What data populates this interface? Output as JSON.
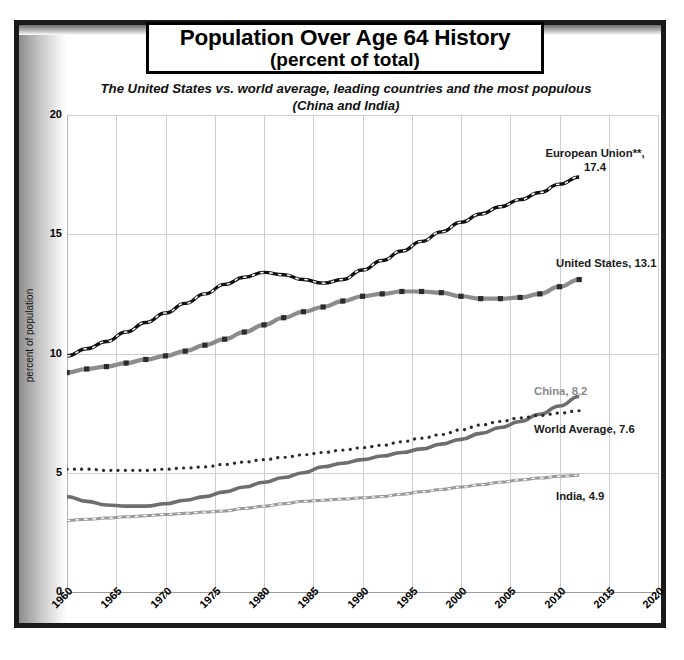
{
  "title": {
    "line1": "Population Over Age 64 History",
    "line2": "(percent of total)"
  },
  "subtitle": "The United States vs. world average,\nleading countries and the most populous (China and India)",
  "colors": {
    "frame": "#1a1a1a",
    "grid": "#cfcfcf",
    "european_union": "#111111",
    "united_states": "#8c8c8c",
    "china": "#6e6e6e",
    "world_average": "#2b2b2b",
    "india": "#9a9a9a",
    "china_label": "#8a8a8a"
  },
  "annotations": {
    "european_union": "European Union**,\n17.4",
    "united_states": "United States, 13.1",
    "china": "China, 8.2",
    "world_average": "World Average, 7.6",
    "india": "India, 4.9"
  },
  "chart_data": {
    "type": "line",
    "title": "Population Over Age 64 History (percent of total)",
    "subtitle": "The United States vs. world average, leading countries and the most populous (China and India)",
    "xlabel": "",
    "ylabel": "percent of population",
    "xlim": [
      1960,
      2020
    ],
    "ylim": [
      0,
      20
    ],
    "xticks": [
      1960,
      1965,
      1970,
      1975,
      1980,
      1985,
      1990,
      1995,
      2000,
      2005,
      2010,
      2015,
      2020
    ],
    "yticks": [
      0,
      5,
      10,
      15,
      20
    ],
    "grid": true,
    "legend": "inline-end-labels",
    "x": [
      1960,
      1962,
      1964,
      1966,
      1968,
      1970,
      1972,
      1974,
      1976,
      1978,
      1980,
      1982,
      1984,
      1986,
      1988,
      1990,
      1992,
      1994,
      1996,
      1998,
      2000,
      2002,
      2004,
      2006,
      2008,
      2010,
      2012
    ],
    "series": [
      {
        "name": "European Union**",
        "style": "dark-line-white-dashes",
        "end_value": 17.4,
        "values": [
          9.9,
          10.2,
          10.5,
          10.9,
          11.3,
          11.7,
          12.1,
          12.5,
          12.9,
          13.2,
          13.4,
          13.3,
          13.1,
          12.95,
          13.1,
          13.5,
          13.9,
          14.3,
          14.7,
          15.1,
          15.5,
          15.85,
          16.15,
          16.45,
          16.75,
          17.1,
          17.4
        ]
      },
      {
        "name": "United States",
        "style": "gray-line-square-markers",
        "end_value": 13.1,
        "values": [
          9.2,
          9.35,
          9.45,
          9.6,
          9.75,
          9.9,
          10.1,
          10.35,
          10.6,
          10.9,
          11.2,
          11.5,
          11.75,
          11.95,
          12.2,
          12.4,
          12.5,
          12.6,
          12.6,
          12.55,
          12.4,
          12.3,
          12.3,
          12.35,
          12.5,
          12.8,
          13.1
        ]
      },
      {
        "name": "China",
        "style": "solid-gray-thick",
        "end_value": 8.2,
        "values": [
          4.0,
          3.8,
          3.65,
          3.6,
          3.6,
          3.7,
          3.85,
          4.0,
          4.2,
          4.4,
          4.6,
          4.8,
          5.0,
          5.25,
          5.4,
          5.55,
          5.7,
          5.85,
          6.0,
          6.2,
          6.4,
          6.65,
          6.9,
          7.15,
          7.45,
          7.8,
          8.2
        ]
      },
      {
        "name": "World Average",
        "style": "dotted",
        "end_value": 7.6,
        "values": [
          5.15,
          5.15,
          5.1,
          5.1,
          5.1,
          5.15,
          5.2,
          5.25,
          5.35,
          5.45,
          5.55,
          5.65,
          5.75,
          5.85,
          5.95,
          6.05,
          6.15,
          6.3,
          6.45,
          6.6,
          6.8,
          7.0,
          7.15,
          7.3,
          7.4,
          7.5,
          7.6
        ]
      },
      {
        "name": "India",
        "style": "gray-line-white-dashes",
        "end_value": 4.9,
        "values": [
          3.0,
          3.05,
          3.1,
          3.15,
          3.2,
          3.25,
          3.3,
          3.35,
          3.4,
          3.5,
          3.6,
          3.7,
          3.8,
          3.85,
          3.9,
          3.95,
          4.0,
          4.1,
          4.2,
          4.3,
          4.4,
          4.5,
          4.6,
          4.7,
          4.78,
          4.85,
          4.9
        ]
      }
    ]
  }
}
